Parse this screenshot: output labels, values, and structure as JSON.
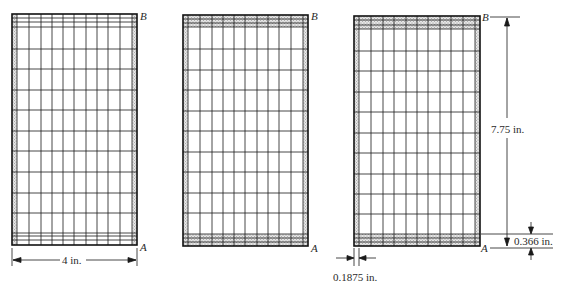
{
  "diagram": {
    "panels": [
      {
        "id": "panel-1",
        "x": 12,
        "y": 14,
        "w": 125,
        "h": 231,
        "shade_sides": [
          "left",
          "right"
        ],
        "label_top": "B",
        "label_bottom": "A"
      },
      {
        "id": "panel-2",
        "x": 183,
        "y": 15,
        "w": 125,
        "h": 231,
        "shade_sides": [
          "left",
          "right",
          "top",
          "bottom"
        ],
        "label_top": "B",
        "label_bottom": "A"
      },
      {
        "id": "panel-3",
        "x": 354,
        "y": 16,
        "w": 126,
        "h": 230,
        "shade_sides": [
          "left",
          "right",
          "top",
          "bottom"
        ],
        "label_top": "B",
        "label_bottom": "A"
      }
    ],
    "dimensions": {
      "width": "4 in.",
      "height": "7.75 in.",
      "edge_band": "0.366 in.",
      "edge_strip": "0.1875 in."
    },
    "colors": {
      "line": "#1a1a1a",
      "shade": "#bdbdbd",
      "background": "#ffffff"
    }
  }
}
